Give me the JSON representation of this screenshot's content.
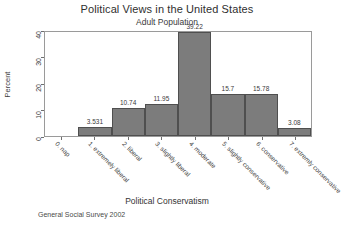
{
  "chart_data": {
    "type": "bar",
    "title": "Political Views in the United States",
    "subtitle": "Adult Population",
    "xlabel": "Political Conservatism",
    "ylabel": "Percent",
    "footnote": "General Social Survey 2002",
    "categories": [
      "0. nap",
      "1. extremely liberal",
      "2. liberal",
      "3. slightly liberal",
      "4. moderate",
      "5. slightly conservative",
      "6. conservative",
      "7. extremly conservative"
    ],
    "values": [
      0,
      3.531,
      10.74,
      11.95,
      39.22,
      15.7,
      15.78,
      3.08
    ],
    "value_labels": [
      "",
      "3.531",
      "10.74",
      "11.95",
      "39.22",
      "15.7",
      "15.78",
      "3.08"
    ],
    "ylim": [
      0,
      40
    ],
    "yticks": [
      0,
      10,
      20,
      30,
      40
    ],
    "ytick_labels": [
      "0",
      "10",
      "20",
      "30",
      "40"
    ],
    "grid": false,
    "legend": "none",
    "bar_color": "#7c7c7c",
    "bar_edge_color": "#4f4f4f",
    "frame_color": "#9a9a9a",
    "background": "#ffffff"
  }
}
